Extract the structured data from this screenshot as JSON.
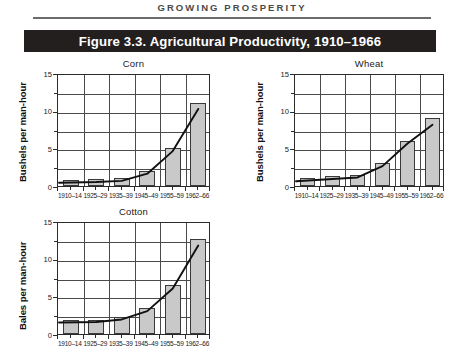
{
  "running_head": "GROWING PROSPERITY",
  "figure": {
    "title": "Figure 3.3. Agricultural Productivity, 1910–1966",
    "title_bar_color": "#231f1f",
    "title_text_color": "#ffffff"
  },
  "style": {
    "bar_fill": "#c9c9c9",
    "bar_stroke": "#3a3a3a",
    "grid_color": "#4a4a4a",
    "axis_color": "#2b2b2b",
    "trend_color": "#111111",
    "page_background": "#ffffff"
  },
  "chart_data": [
    {
      "type": "bar",
      "title": "Corn",
      "xlabel": "",
      "ylabel": "Bushels per man-hour",
      "categories": [
        "1910–14",
        "1925–29",
        "1935–39",
        "1945–49",
        "1955–59",
        "1962–66"
      ],
      "values": [
        0.8,
        0.9,
        1.0,
        2.0,
        5.0,
        11.0
      ],
      "ylim": [
        0,
        15
      ],
      "yticks": [
        0,
        5,
        10,
        15
      ],
      "ytick_labels": [
        "0",
        "5",
        "10",
        "15"
      ],
      "yminor_step": 2.5,
      "grid": true,
      "legend": "none",
      "series": [
        {
          "name": "trend",
          "type": "line",
          "values": [
            0.7,
            0.8,
            0.95,
            1.9,
            4.9,
            10.5
          ]
        }
      ]
    },
    {
      "type": "bar",
      "title": "Wheat",
      "xlabel": "",
      "ylabel": "Bushels per man-hour",
      "categories": [
        "1910–14",
        "1925–29",
        "1935–39",
        "1945–49",
        "1955–59",
        "1962–66"
      ],
      "values": [
        1.0,
        1.3,
        1.5,
        3.0,
        6.0,
        9.0
      ],
      "ylim": [
        0,
        15
      ],
      "yticks": [
        0,
        5,
        10,
        15
      ],
      "ytick_labels": [
        "0",
        "5",
        "10",
        "15"
      ],
      "yminor_step": 2.5,
      "grid": true,
      "legend": "none",
      "series": [
        {
          "name": "trend",
          "type": "line",
          "values": [
            0.9,
            1.2,
            1.4,
            2.9,
            5.9,
            8.4
          ]
        }
      ]
    },
    {
      "type": "bar",
      "title": "Cotton",
      "xlabel": "",
      "ylabel": "Bales per man-hour",
      "categories": [
        "1910–14",
        "1925–29",
        "1935–39",
        "1945–49",
        "1955–59",
        "1962–66"
      ],
      "values": [
        1.9,
        1.9,
        2.3,
        3.4,
        6.5,
        12.6
      ],
      "ylim": [
        0,
        15
      ],
      "yticks": [
        0,
        5,
        10,
        15
      ],
      "ytick_labels": [
        "0",
        "5",
        "10",
        "15"
      ],
      "yminor_step": 2.5,
      "grid": true,
      "legend": "none",
      "series": [
        {
          "name": "trend",
          "type": "line",
          "values": [
            1.8,
            1.85,
            2.2,
            3.3,
            6.3,
            12.0
          ]
        }
      ]
    }
  ]
}
